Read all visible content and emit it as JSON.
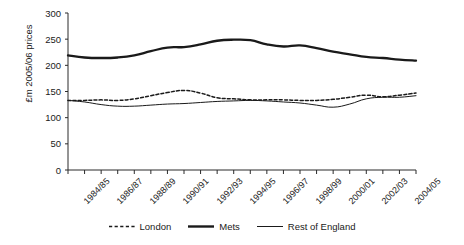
{
  "chart_data": {
    "type": "line",
    "title": "",
    "xlabel": "",
    "ylabel": "£m 2005/06 prices",
    "ylim": [
      0,
      300
    ],
    "yticks": [
      0,
      50,
      100,
      150,
      200,
      250,
      300
    ],
    "grid": false,
    "legend_position": "bottom",
    "x": [
      "1984/85",
      "1985/86",
      "1986/87",
      "1987/88",
      "1988/89",
      "1989/90",
      "1990/91",
      "1991/92",
      "1992/93",
      "1993/94",
      "1994/95",
      "1995/96",
      "1996/97",
      "1997/98",
      "1998/99",
      "1999/00",
      "2000/01",
      "2001/02",
      "2002/03",
      "2003/04",
      "2004/05",
      "2005/06"
    ],
    "xticklabels": [
      "1984/85",
      "1986/87",
      "1988/89",
      "1990/91",
      "1992/93",
      "1994/95",
      "1996/97",
      "1998/99",
      "2000/01",
      "2002/03",
      "2004/05"
    ],
    "series": [
      {
        "name": "London",
        "style": "dashed",
        "values": [
          133,
          133,
          134,
          133,
          136,
          142,
          148,
          152,
          147,
          138,
          136,
          134,
          134,
          134,
          133,
          133,
          135,
          139,
          143,
          140,
          143,
          147
        ]
      },
      {
        "name": "Mets",
        "style": "thick-solid",
        "values": [
          219,
          215,
          214,
          215,
          219,
          227,
          234,
          235,
          240,
          247,
          249,
          248,
          240,
          236,
          238,
          233,
          226,
          221,
          216,
          214,
          211,
          209
        ]
      },
      {
        "name": "Rest of England",
        "style": "thin-solid",
        "values": [
          133,
          130,
          125,
          122,
          122,
          124,
          126,
          127,
          129,
          131,
          132,
          133,
          132,
          130,
          128,
          124,
          120,
          126,
          136,
          139,
          139,
          142
        ]
      }
    ]
  },
  "legend": {
    "items": [
      {
        "label": "London",
        "swatch": "dashed-line-swatch"
      },
      {
        "label": "Mets",
        "swatch": "thick-solid-line-swatch"
      },
      {
        "label": "Rest of England",
        "swatch": "thin-solid-line-swatch"
      }
    ]
  },
  "axis": {
    "y_title": "£m 2005/06 prices"
  }
}
